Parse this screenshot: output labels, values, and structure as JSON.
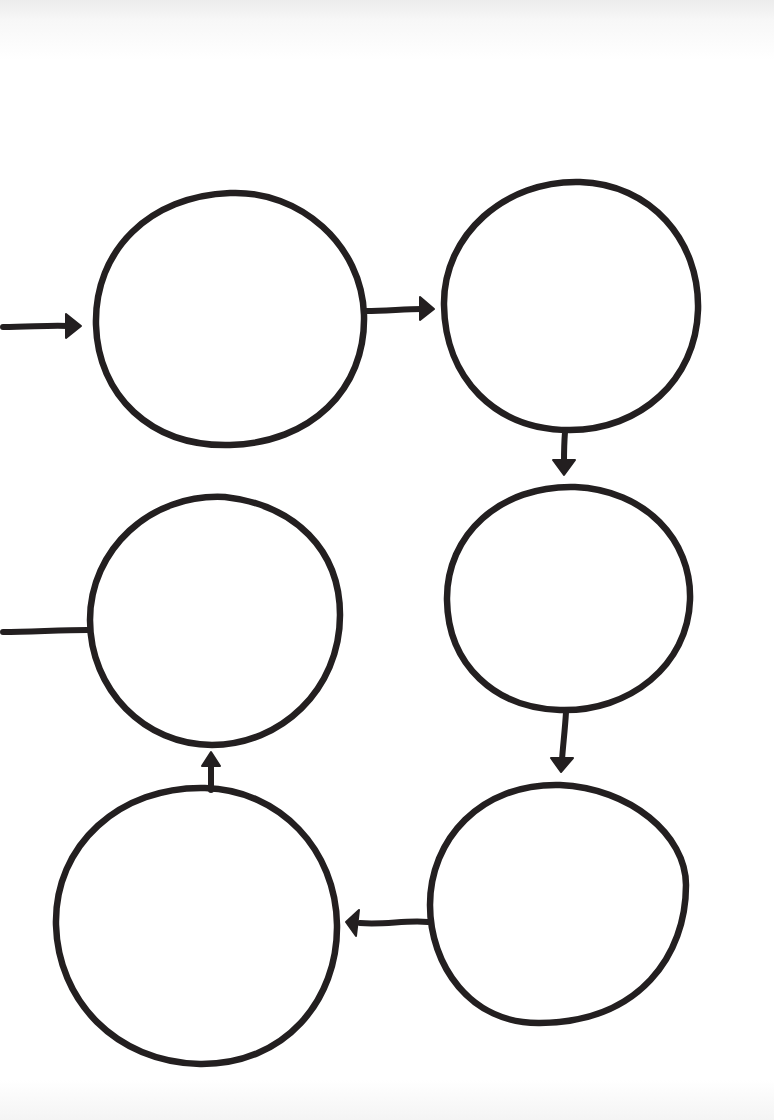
{
  "diagram": {
    "title": "",
    "ink_color": "#231f20",
    "background_color": "#ffffff",
    "nodes": [
      {
        "id": "n1",
        "label": "",
        "position": "top-left"
      },
      {
        "id": "n2",
        "label": "",
        "position": "top-right"
      },
      {
        "id": "n3",
        "label": "",
        "position": "middle-left"
      },
      {
        "id": "n4",
        "label": "",
        "position": "middle-right"
      },
      {
        "id": "n5",
        "label": "",
        "position": "bottom-left"
      },
      {
        "id": "n6",
        "label": "",
        "position": "bottom-right"
      }
    ],
    "edges": [
      {
        "from": "input",
        "to": "n1",
        "arrow": true
      },
      {
        "from": "n1",
        "to": "n2",
        "arrow": true
      },
      {
        "from": "n2",
        "to": "n4",
        "arrow": true
      },
      {
        "from": "n4",
        "to": "n6",
        "arrow": true
      },
      {
        "from": "n6",
        "to": "n5",
        "arrow": true
      },
      {
        "from": "n5",
        "to": "n3",
        "arrow": true
      },
      {
        "from": "n3",
        "to": "output",
        "arrow": false
      }
    ]
  }
}
